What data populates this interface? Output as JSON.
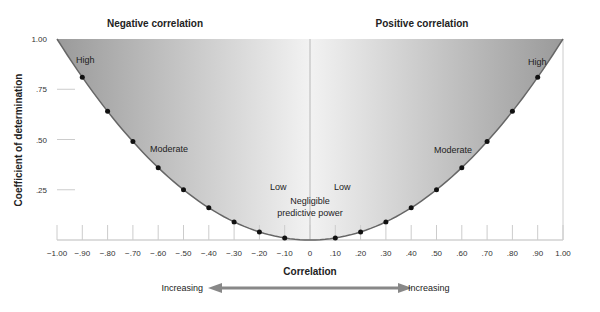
{
  "chart_data": {
    "type": "line",
    "title": "",
    "xlabel": "Correlation",
    "ylabel": "Coefficient of determination",
    "xlim": [
      -1.0,
      1.0
    ],
    "ylim": [
      0,
      1.0
    ],
    "x_ticks": [
      "-1.00",
      "-.90",
      "-.80",
      "-.70",
      "-.60",
      "-.50",
      "-.40",
      "-.30",
      "-.20",
      "-.10",
      "0",
      ".10",
      ".20",
      ".30",
      ".40",
      ".50",
      ".60",
      ".70",
      ".80",
      ".90",
      "1.00"
    ],
    "y_ticks": [
      "1.00",
      ".75",
      ".50",
      ".25"
    ],
    "series": [
      {
        "name": "r squared",
        "x": [
          -0.9,
          -0.8,
          -0.7,
          -0.6,
          -0.5,
          -0.4,
          -0.3,
          -0.2,
          -0.1,
          0.1,
          0.2,
          0.3,
          0.4,
          0.5,
          0.6,
          0.7,
          0.8,
          0.9
        ],
        "y": [
          0.81,
          0.64,
          0.49,
          0.36,
          0.25,
          0.16,
          0.09,
          0.04,
          0.01,
          0.01,
          0.04,
          0.09,
          0.16,
          0.25,
          0.36,
          0.49,
          0.64,
          0.81
        ]
      }
    ],
    "section_labels": {
      "left": "Negative correlation",
      "right": "Positive correlation"
    },
    "annotations": {
      "left_high": "High",
      "left_moderate": "Moderate",
      "left_low": "Low",
      "right_high": "High",
      "right_moderate": "Moderate",
      "right_low": "Low",
      "center_line1": "Negligible",
      "center_line2": "predictive power"
    },
    "arrow": {
      "left_label": "Increasing",
      "right_label": "Increasing"
    },
    "grid": false,
    "legend": "none"
  }
}
